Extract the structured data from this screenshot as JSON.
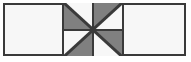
{
  "figure": {
    "canvas": {
      "width": 191,
      "height": 62
    }
  },
  "colors": {
    "outline": "#3a3a3a",
    "shaded": "#808080",
    "unshaded": "#f7f7f7",
    "background": "#ffffff",
    "panel_fill": "#f7f7f7"
  },
  "outer_rect": {
    "label": "outer-rectangle",
    "x": 3,
    "y": 3,
    "width": 183,
    "height": 53,
    "fill": "#f6f6f6",
    "stroke": "#3a3a3a",
    "stroke_width": 2
  },
  "panels": [
    {
      "name": "left-panel",
      "label": "",
      "shaded": false,
      "x": 5,
      "y": 5,
      "width": 57,
      "height": 49
    },
    {
      "name": "center-panel",
      "label": "",
      "shaded": false,
      "x": 62,
      "y": 3,
      "width": 62,
      "height": 53
    },
    {
      "name": "right-panel",
      "label": "",
      "shaded": false,
      "x": 124,
      "y": 5,
      "width": 60,
      "height": 49
    }
  ],
  "pinwheel": {
    "name": "pinwheel",
    "blades": 4,
    "center": {
      "x": 93,
      "y": 31
    },
    "rows": 2,
    "cols": 2,
    "quadrants": [
      {
        "name": "quadrant-top-left",
        "position": "top-left",
        "diagonal": "tl-br",
        "shaded_half": "lower-left",
        "shaded_points": "0,0 0,100 100,100",
        "unshaded_points": "0,0 100,0 100,100"
      },
      {
        "name": "quadrant-top-right",
        "position": "top-right",
        "diagonal": "tl-br",
        "shaded_half": "upper-left",
        "shaded_points": "0,0 100,0 0,100",
        "unshaded_points": "100,0 100,100 0,100"
      },
      {
        "name": "quadrant-bottom-left",
        "position": "bottom-left",
        "diagonal": "tl-br",
        "shaded_half": "lower-right",
        "shaded_points": "100,0 100,100 0,100",
        "unshaded_points": "0,0 100,0 0,100"
      },
      {
        "name": "quadrant-bottom-right",
        "position": "bottom-right",
        "diagonal": "tl-br",
        "shaded_half": "upper-right",
        "shaded_points": "0,0 100,0 100,100",
        "unshaded_points": "0,0 100,100 0,100"
      }
    ]
  }
}
